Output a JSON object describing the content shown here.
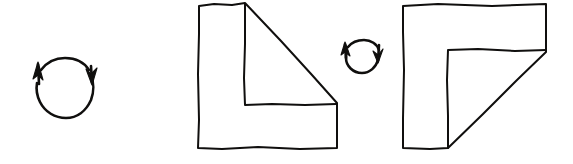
{
  "figure": {
    "title": "Hand-drawn shape rotation sequence",
    "background_color": "#ffffff",
    "ink_color": "#100f0e",
    "width": 573,
    "height": 164,
    "style": "hand-drawn pen sketch, black ink on white paper, no text labels"
  },
  "elements": [
    {
      "id": "rotation-arrow-left",
      "type": "circular-arrow",
      "label": "large clockwise rotation arrow",
      "direction": "clockwise",
      "center_x": 65,
      "center_y": 88,
      "radius_x": 28,
      "radius_y": 29,
      "arrowheads": 2,
      "arrowhead_left_direction": "up",
      "arrowhead_right_direction": "down"
    },
    {
      "id": "shape-before",
      "type": "polygon",
      "label": "L-shaped polygon with diagonal hypotenuse, apex at top right",
      "orientation_degrees": 0,
      "vertices": [
        [
          199,
          5
        ],
        [
          245,
          3
        ],
        [
          337,
          103
        ],
        [
          337,
          148
        ],
        [
          198,
          148
        ],
        [
          199,
          5
        ]
      ],
      "inner_notch_vertices": [
        [
          245,
          3
        ],
        [
          245,
          105
        ],
        [
          336,
          104
        ]
      ]
    },
    {
      "id": "rotation-arrow-right",
      "type": "circular-arrow",
      "label": "small clockwise rotation arrow",
      "direction": "clockwise",
      "center_x": 362,
      "center_y": 57,
      "radius_x": 17,
      "radius_y": 17,
      "arrowheads": 2,
      "arrowhead_left_direction": "up",
      "arrowhead_right_direction": "down"
    },
    {
      "id": "shape-after",
      "type": "polygon",
      "label": "same L-shaped polygon rotated 90 degrees clockwise, apex at bottom left",
      "orientation_degrees": 90,
      "vertices": [
        [
          403,
          5
        ],
        [
          546,
          4
        ],
        [
          546,
          52
        ],
        [
          448,
          148
        ],
        [
          403,
          148
        ],
        [
          403,
          5
        ]
      ],
      "inner_notch_vertices": [
        [
          448,
          50
        ],
        [
          546,
          50
        ],
        [
          448,
          148
        ]
      ]
    }
  ],
  "reading": {
    "sequence": "rotate clockwise, shape, rotate clockwise, rotated shape",
    "transformation": "90 degree clockwise rotation",
    "step_count": 4
  }
}
